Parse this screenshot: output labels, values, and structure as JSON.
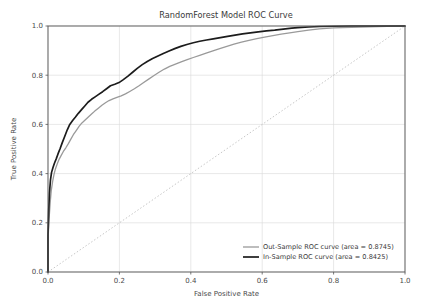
{
  "chart_data": {
    "type": "line",
    "title": "RandomForest Model ROC Curve",
    "xlabel": "False Positive Rate",
    "ylabel": "True Positive Rate",
    "xlim": [
      0.0,
      1.0
    ],
    "ylim": [
      0.0,
      1.0
    ],
    "xticks": [
      "0.0",
      "0.2",
      "0.4",
      "0.6",
      "0.8",
      "1.0"
    ],
    "xtick_values": [
      0.0,
      0.2,
      0.4,
      0.6,
      0.8,
      1.0
    ],
    "yticks": [
      "0.0",
      "0.2",
      "0.4",
      "0.6",
      "0.8",
      "1.0"
    ],
    "ytick_values": [
      0.0,
      0.2,
      0.4,
      0.6,
      0.8,
      1.0
    ],
    "grid": true,
    "legend_position": "lower right",
    "reference_line": {
      "name": "chance-diagonal",
      "x": [
        0.0,
        1.0
      ],
      "y": [
        0.0,
        1.0
      ],
      "style": "dotted",
      "color": "#b9b9b9"
    },
    "series": [
      {
        "name": "Out-Sample ROC curve",
        "legend_label": "Out-Sample ROC curve (area = 0.8745)",
        "area": 0.8745,
        "color": "#9a9a9a",
        "width": 1.3,
        "x": [
          0.0,
          0.0,
          0.003,
          0.006,
          0.009,
          0.013,
          0.017,
          0.021,
          0.026,
          0.031,
          0.037,
          0.043,
          0.05,
          0.057,
          0.064,
          0.071,
          0.079,
          0.087,
          0.095,
          0.104,
          0.113,
          0.122,
          0.131,
          0.141,
          0.151,
          0.161,
          0.171,
          0.182,
          0.193,
          0.205,
          0.217,
          0.229,
          0.242,
          0.255,
          0.268,
          0.282,
          0.296,
          0.311,
          0.326,
          0.341,
          0.357,
          0.373,
          0.39,
          0.407,
          0.425,
          0.443,
          0.462,
          0.481,
          0.501,
          0.521,
          0.542,
          0.563,
          0.585,
          0.607,
          0.63,
          0.653,
          0.677,
          0.7,
          0.73,
          0.76,
          0.8,
          0.85,
          0.9,
          0.95,
          1.0
        ],
        "y": [
          0.0,
          0.13,
          0.215,
          0.28,
          0.33,
          0.368,
          0.398,
          0.42,
          0.44,
          0.458,
          0.474,
          0.49,
          0.505,
          0.522,
          0.54,
          0.558,
          0.575,
          0.592,
          0.606,
          0.618,
          0.63,
          0.642,
          0.654,
          0.666,
          0.678,
          0.688,
          0.697,
          0.704,
          0.71,
          0.716,
          0.724,
          0.734,
          0.745,
          0.757,
          0.77,
          0.784,
          0.798,
          0.812,
          0.825,
          0.836,
          0.845,
          0.854,
          0.863,
          0.872,
          0.881,
          0.89,
          0.899,
          0.908,
          0.917,
          0.926,
          0.934,
          0.942,
          0.949,
          0.955,
          0.961,
          0.967,
          0.972,
          0.977,
          0.983,
          0.988,
          0.992,
          0.995,
          0.997,
          0.999,
          1.0
        ]
      },
      {
        "name": "In-Sample ROC curve",
        "legend_label": "In-Sample ROC curve (area = 0.8425)",
        "area": 0.8425,
        "color": "#1c1c1c",
        "width": 1.7,
        "x": [
          0.0,
          0.0,
          0.002,
          0.004,
          0.007,
          0.01,
          0.014,
          0.018,
          0.023,
          0.028,
          0.034,
          0.04,
          0.047,
          0.054,
          0.061,
          0.069,
          0.077,
          0.085,
          0.094,
          0.103,
          0.112,
          0.122,
          0.132,
          0.142,
          0.153,
          0.164,
          0.175,
          0.187,
          0.199,
          0.211,
          0.224,
          0.237,
          0.25,
          0.264,
          0.278,
          0.293,
          0.308,
          0.323,
          0.339,
          0.355,
          0.372,
          0.389,
          0.407,
          0.425,
          0.444,
          0.463,
          0.483,
          0.503,
          0.524,
          0.545,
          0.567,
          0.589,
          0.612,
          0.635,
          0.659,
          0.683,
          0.7,
          0.73,
          0.76,
          0.8,
          0.85,
          0.9,
          0.95,
          1.0
        ],
        "y": [
          0.0,
          0.15,
          0.25,
          0.32,
          0.375,
          0.405,
          0.425,
          0.442,
          0.46,
          0.48,
          0.502,
          0.526,
          0.552,
          0.578,
          0.6,
          0.616,
          0.63,
          0.645,
          0.66,
          0.675,
          0.69,
          0.702,
          0.712,
          0.722,
          0.733,
          0.745,
          0.757,
          0.763,
          0.77,
          0.782,
          0.796,
          0.812,
          0.828,
          0.843,
          0.856,
          0.868,
          0.878,
          0.888,
          0.898,
          0.908,
          0.917,
          0.925,
          0.932,
          0.938,
          0.943,
          0.948,
          0.953,
          0.958,
          0.963,
          0.968,
          0.972,
          0.976,
          0.98,
          0.983,
          0.987,
          0.991,
          0.993,
          0.996,
          0.998,
          0.999,
          1.0,
          1.0,
          1.0,
          1.0
        ]
      }
    ]
  }
}
